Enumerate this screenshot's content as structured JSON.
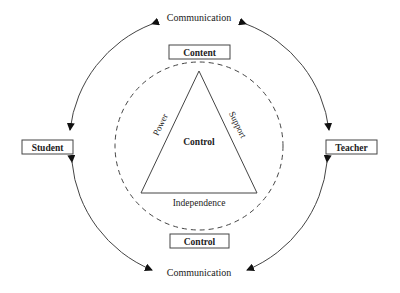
{
  "diagram": {
    "nodes": {
      "student": "Student",
      "teacher": "Teacher",
      "content": "Content",
      "control_box": "Control"
    },
    "triangle": {
      "center": "Control",
      "left_side": "Power",
      "right_side": "Support",
      "base": "Independence"
    },
    "edges": {
      "top": "Communication",
      "bottom": "Communication"
    }
  }
}
